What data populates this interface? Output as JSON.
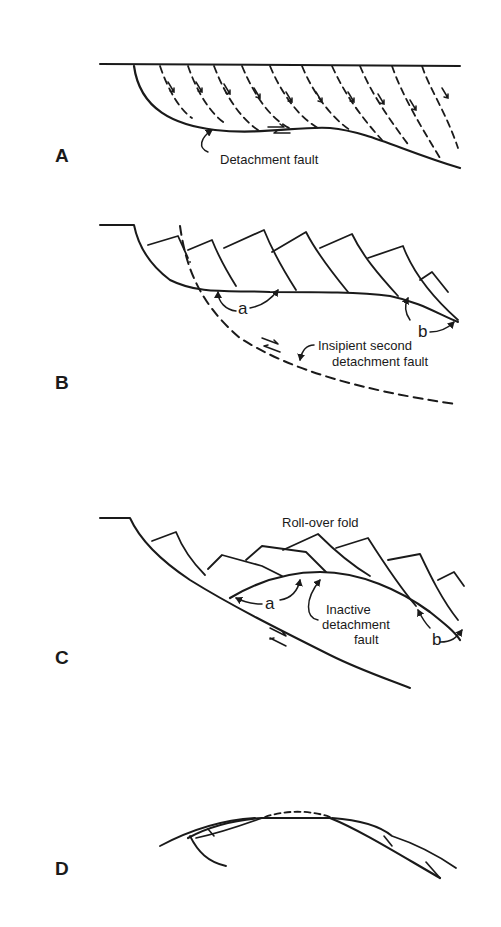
{
  "figure": {
    "colors": {
      "ink": "#1a1a1a",
      "background": "#ffffff"
    },
    "panels": [
      {
        "id": "A",
        "label": "A",
        "annotations": [
          {
            "text": "Detachment fault"
          }
        ]
      },
      {
        "id": "B",
        "label": "B",
        "annotations": [
          {
            "text": "a"
          },
          {
            "text": "b"
          },
          {
            "text": "Insipient second"
          },
          {
            "text": "detachment fault"
          }
        ]
      },
      {
        "id": "C",
        "label": "C",
        "annotations": [
          {
            "text": "Roll-over fold"
          },
          {
            "text": "a"
          },
          {
            "text": "Inactive"
          },
          {
            "text": "detachment"
          },
          {
            "text": "fault"
          },
          {
            "text": "b"
          }
        ]
      },
      {
        "id": "D",
        "label": "D",
        "annotations": []
      }
    ]
  }
}
